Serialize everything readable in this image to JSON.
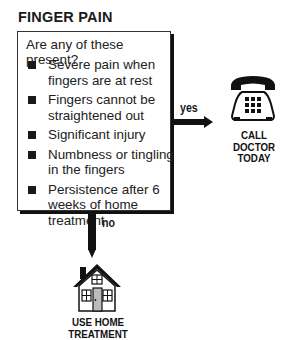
{
  "title": "FINGER PAIN",
  "question": "Are any of these present?",
  "symptoms": [
    "Severe pain when fingers are at rest",
    "Fingers cannot be straightened out",
    "Significant injury",
    "Numbness or tingling in the fingers",
    "Persistence after 6 weeks of home treatment"
  ],
  "branches": {
    "yes": {
      "label": "yes",
      "outcome": "CALL DOCTOR TODAY",
      "icon": "telephone-icon"
    },
    "no": {
      "label": "no",
      "outcome": "USE HOME TREATMENT",
      "icon": "house-icon"
    }
  }
}
